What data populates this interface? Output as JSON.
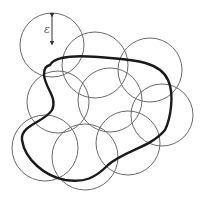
{
  "diagram": {
    "radius_label": "ε",
    "colors": {
      "background": "#ffffff",
      "circle_stroke": "#6a6a6a",
      "curve_stroke": "#1a1a1a",
      "arrow": "#333333"
    },
    "circles": [
      {
        "id": "c1",
        "cx": 52,
        "cy": 45,
        "r": 32
      },
      {
        "id": "c2",
        "cx": 95,
        "cy": 65,
        "r": 33
      },
      {
        "id": "c3",
        "cx": 150,
        "cy": 70,
        "r": 32
      },
      {
        "id": "c4",
        "cx": 58,
        "cy": 102,
        "r": 31
      },
      {
        "id": "c5",
        "cx": 110,
        "cy": 100,
        "r": 32
      },
      {
        "id": "c6",
        "cx": 162,
        "cy": 115,
        "r": 31
      },
      {
        "id": "c7",
        "cx": 45,
        "cy": 148,
        "r": 33
      },
      {
        "id": "c8",
        "cx": 85,
        "cy": 157,
        "r": 33
      },
      {
        "id": "c9",
        "cx": 128,
        "cy": 143,
        "r": 32
      }
    ],
    "radius_arrow": {
      "x": 52,
      "y1": 13,
      "y2": 45
    },
    "curve_path": "M 50 65 C 55 55, 80 55, 110 58 C 135 60, 160 62, 168 80 C 175 95, 170 120, 165 130 C 150 148, 125 150, 108 165 C 95 178, 85 183, 65 180 C 45 176, 25 160, 22 140 C 20 125, 45 122, 52 110 C 58 98, 45 88, 44 75 C 44 68, 46 66, 50 65 Z"
  }
}
